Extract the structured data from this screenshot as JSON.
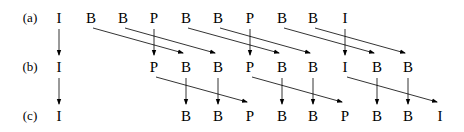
{
  "diagram": {
    "title": "",
    "columns_x": [
      59,
      91,
      123,
      154,
      186,
      218,
      250,
      282,
      313,
      345,
      377,
      408,
      440
    ],
    "rows": [
      {
        "label": "(a)",
        "y": 18,
        "frames": [
          {
            "type": "I",
            "col": 0
          },
          {
            "type": "B",
            "col": 1
          },
          {
            "type": "B",
            "col": 2
          },
          {
            "type": "P",
            "col": 3
          },
          {
            "type": "B",
            "col": 4
          },
          {
            "type": "B",
            "col": 5
          },
          {
            "type": "P",
            "col": 6
          },
          {
            "type": "B",
            "col": 7
          },
          {
            "type": "B",
            "col": 8
          },
          {
            "type": "I",
            "col": 9
          }
        ]
      },
      {
        "label": "(b)",
        "y": 67,
        "frames": [
          {
            "type": "I",
            "col": 0
          },
          {
            "type": "P",
            "col": 3
          },
          {
            "type": "B",
            "col": 4
          },
          {
            "type": "B",
            "col": 5
          },
          {
            "type": "P",
            "col": 6
          },
          {
            "type": "B",
            "col": 7
          },
          {
            "type": "B",
            "col": 8
          },
          {
            "type": "I",
            "col": 9
          },
          {
            "type": "B",
            "col": 10
          },
          {
            "type": "B",
            "col": 11
          }
        ]
      },
      {
        "label": "(c)",
        "y": 116,
        "frames": [
          {
            "type": "I",
            "col": 0
          },
          {
            "type": "B",
            "col": 4
          },
          {
            "type": "B",
            "col": 5
          },
          {
            "type": "P",
            "col": 6
          },
          {
            "type": "B",
            "col": 7
          },
          {
            "type": "B",
            "col": 8
          },
          {
            "type": "P",
            "col": 9
          },
          {
            "type": "B",
            "col": 10
          },
          {
            "type": "B",
            "col": 11
          },
          {
            "type": "I",
            "col": 12
          }
        ]
      }
    ],
    "arrows": [
      {
        "from_row": 0,
        "from_col": 0,
        "to_row": 1,
        "to_col": 0
      },
      {
        "from_row": 0,
        "from_col": 1,
        "to_row": 1,
        "to_col": 4
      },
      {
        "from_row": 0,
        "from_col": 2,
        "to_row": 1,
        "to_col": 5
      },
      {
        "from_row": 0,
        "from_col": 3,
        "to_row": 1,
        "to_col": 3
      },
      {
        "from_row": 0,
        "from_col": 4,
        "to_row": 1,
        "to_col": 7
      },
      {
        "from_row": 0,
        "from_col": 5,
        "to_row": 1,
        "to_col": 8
      },
      {
        "from_row": 0,
        "from_col": 6,
        "to_row": 1,
        "to_col": 6
      },
      {
        "from_row": 0,
        "from_col": 7,
        "to_row": 1,
        "to_col": 10
      },
      {
        "from_row": 0,
        "from_col": 8,
        "to_row": 1,
        "to_col": 11
      },
      {
        "from_row": 0,
        "from_col": 9,
        "to_row": 1,
        "to_col": 9
      },
      {
        "from_row": 1,
        "from_col": 0,
        "to_row": 2,
        "to_col": 0
      },
      {
        "from_row": 1,
        "from_col": 3,
        "to_row": 2,
        "to_col": 6
      },
      {
        "from_row": 1,
        "from_col": 4,
        "to_row": 2,
        "to_col": 4
      },
      {
        "from_row": 1,
        "from_col": 5,
        "to_row": 2,
        "to_col": 5
      },
      {
        "from_row": 1,
        "from_col": 6,
        "to_row": 2,
        "to_col": 9
      },
      {
        "from_row": 1,
        "from_col": 7,
        "to_row": 2,
        "to_col": 7
      },
      {
        "from_row": 1,
        "from_col": 8,
        "to_row": 2,
        "to_col": 8
      },
      {
        "from_row": 1,
        "from_col": 9,
        "to_row": 2,
        "to_col": 12
      },
      {
        "from_row": 1,
        "from_col": 10,
        "to_row": 2,
        "to_col": 10
      },
      {
        "from_row": 1,
        "from_col": 11,
        "to_row": 2,
        "to_col": 11
      }
    ],
    "label_x": 30,
    "stroke_color": "#000000"
  }
}
